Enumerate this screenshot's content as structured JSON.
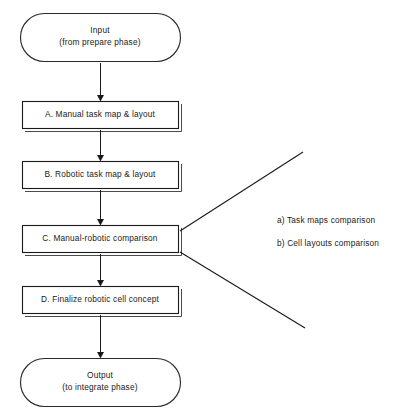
{
  "diagram": {
    "type": "flowchart",
    "orientation": "vertical",
    "background_color": "#ffffff",
    "line_color": "#1a1a1a",
    "text_color": "#1a1a1a",
    "nodes": [
      {
        "id": "input",
        "shape": "terminator",
        "line1": "Input",
        "line2": "(from prepare phase)"
      },
      {
        "id": "step-a",
        "shape": "process",
        "label": "A. Manual task map & layout"
      },
      {
        "id": "step-b",
        "shape": "process",
        "label": "B. Robotic task map & layout"
      },
      {
        "id": "step-c",
        "shape": "process",
        "label": "C. Manual-robotic comparison"
      },
      {
        "id": "step-d",
        "shape": "process",
        "label": "D. Finalize robotic cell concept"
      },
      {
        "id": "output",
        "shape": "terminator",
        "line1": "Output",
        "line2": "(to integrate phase)"
      }
    ],
    "annotations": [
      {
        "id": "annotation-a",
        "label": "a) Task maps comparison"
      },
      {
        "id": "annotation-b",
        "label": "b) Cell layouts comparison"
      }
    ]
  }
}
